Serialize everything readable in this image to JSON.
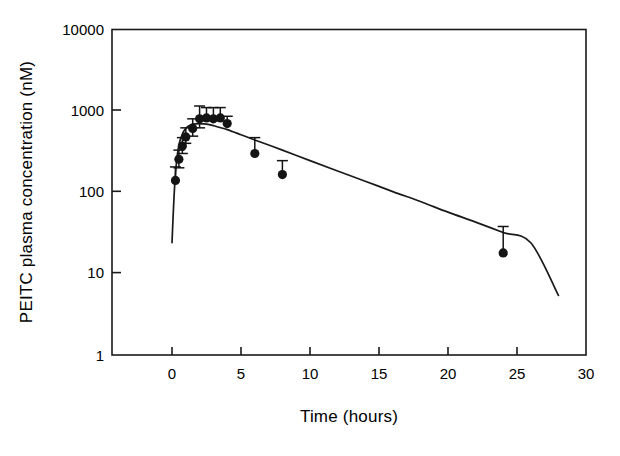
{
  "chart_data": {
    "type": "scatter",
    "title": "",
    "xlabel": "Time (hours)",
    "ylabel": "PEITC plasma concentration (nM)",
    "yscale": "log",
    "xscale": "linear",
    "xlim": [
      -4.3,
      30
    ],
    "ylim": [
      1,
      10000
    ],
    "xticks": [
      0,
      5,
      10,
      15,
      20,
      25,
      30
    ],
    "xtick_labels": [
      "0",
      "5",
      "10",
      "15",
      "20",
      "25",
      "30"
    ],
    "yticks": [
      1,
      10,
      100,
      1000,
      10000
    ],
    "ytick_labels": [
      "1",
      "10",
      "100",
      "1000",
      "10000"
    ],
    "grid": false,
    "legend": false,
    "marker": "filled-circle",
    "marker_color": "#141414",
    "line_color": "#1a1a1a",
    "series": [
      {
        "name": "observed",
        "type": "scatter-with-errorbars",
        "x": [
          0.25,
          0.5,
          0.75,
          1.0,
          1.5,
          2.0,
          2.5,
          3.0,
          3.5,
          4.0,
          6.0,
          8.0,
          24.0
        ],
        "y": [
          140,
          255,
          370,
          480,
          610,
          800,
          820,
          800,
          820,
          700,
          300,
          165,
          18
        ],
        "yerr_upper": [
          205,
          330,
          470,
          620,
          800,
          1150,
          1100,
          1100,
          1100,
          860,
          470,
          245,
          38
        ],
        "yerr_lower": [
          140,
          200,
          300,
          400,
          490,
          620,
          820,
          800,
          820,
          700,
          300,
          165,
          18
        ]
      },
      {
        "name": "fitted model curve",
        "type": "line",
        "x": [
          0.0,
          0.15,
          0.3,
          0.5,
          0.75,
          1.0,
          1.25,
          1.5,
          2.0,
          2.5,
          3.0,
          4.0,
          5.0,
          6.0,
          8.0,
          10.0,
          12.0,
          14.0,
          16.0,
          18.0,
          20.0,
          22.0,
          24.0,
          26.0,
          28.0
        ],
        "y": [
          24,
          90,
          210,
          380,
          520,
          610,
          660,
          690,
          700,
          690,
          660,
          590,
          510,
          440,
          330,
          245,
          183,
          137,
          102,
          77,
          57,
          43,
          32,
          24,
          5.4
        ]
      }
    ]
  },
  "axes": {
    "x_title": "Time (hours)",
    "y_title": "PEITC plasma concentration (nM)"
  }
}
